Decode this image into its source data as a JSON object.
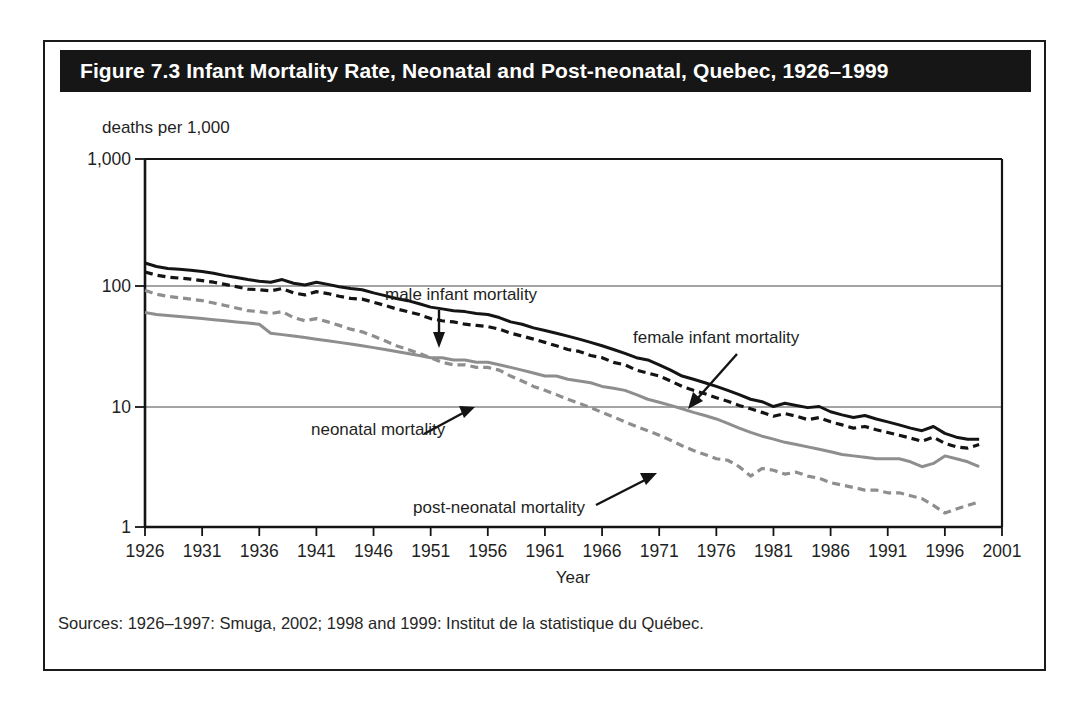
{
  "figure": {
    "title": "Figure 7.3 Infant Mortality Rate, Neonatal and Post-neonatal, Quebec, 1926–1999",
    "source_note": "Sources: 1926–1997: Smuga, 2002; 1998 and 1999: Institut de la statistique du Québec.",
    "title_bar_color": "#161616",
    "title_text_color": "#ffffff",
    "border_color": "#1a1a1a"
  },
  "chart_data": {
    "type": "line",
    "title": "Figure 7.3 Infant Mortality Rate, Neonatal and Post-neonatal, Quebec, 1926–1999",
    "xlabel": "Year",
    "ylabel": "deaths per 1,000",
    "yscale": "log",
    "ylim": [
      1,
      1000
    ],
    "xlim": [
      1926,
      2001
    ],
    "ytick_labels": [
      "1",
      "10",
      "100",
      "1,000"
    ],
    "ytick_values": [
      1,
      10,
      100,
      1000
    ],
    "xtick_labels": [
      "1926",
      "1931",
      "1936",
      "1941",
      "1946",
      "1951",
      "1956",
      "1961",
      "1966",
      "1971",
      "1976",
      "1981",
      "1986",
      "1991",
      "1996",
      "2001"
    ],
    "xtick_values": [
      1926,
      1931,
      1936,
      1941,
      1946,
      1951,
      1956,
      1961,
      1966,
      1971,
      1976,
      1981,
      1986,
      1991,
      1996,
      2001
    ],
    "grid": "horizontal-at-10-and-100",
    "legend_position": "inline-annotations",
    "x": [
      1926,
      1927,
      1928,
      1929,
      1930,
      1931,
      1932,
      1933,
      1934,
      1935,
      1936,
      1937,
      1938,
      1939,
      1940,
      1941,
      1942,
      1943,
      1944,
      1945,
      1946,
      1947,
      1948,
      1949,
      1950,
      1951,
      1952,
      1953,
      1954,
      1955,
      1956,
      1957,
      1958,
      1959,
      1960,
      1961,
      1962,
      1963,
      1964,
      1965,
      1966,
      1967,
      1968,
      1969,
      1970,
      1971,
      1972,
      1973,
      1974,
      1975,
      1976,
      1977,
      1978,
      1979,
      1980,
      1981,
      1982,
      1983,
      1984,
      1985,
      1986,
      1987,
      1988,
      1989,
      1990,
      1991,
      1992,
      1993,
      1994,
      1995,
      1996,
      1997,
      1998,
      1999
    ],
    "series": [
      {
        "name": "male infant mortality",
        "color": "#141414",
        "style": "solid",
        "width": 3,
        "values": [
          142,
          133,
          128,
          126,
          124,
          121,
          117,
          112,
          108,
          104,
          101,
          99,
          104,
          97,
          94,
          99,
          95,
          91,
          88,
          86,
          81,
          77,
          73,
          70,
          66,
          62,
          60,
          58,
          57,
          55,
          54,
          51,
          47,
          45,
          42,
          40,
          38,
          36,
          34,
          32,
          30,
          28,
          26,
          24,
          23,
          21,
          19,
          17,
          16,
          15,
          14,
          13,
          12,
          11,
          10.5,
          9.6,
          10.2,
          9.8,
          9.4,
          9.6,
          8.7,
          8.2,
          7.8,
          8.1,
          7.6,
          7.2,
          6.8,
          6.4,
          6.1,
          6.6,
          5.8,
          5.4,
          5.2,
          5.2
        ]
      },
      {
        "name": "female infant mortality",
        "color": "#141414",
        "style": "dashed",
        "width": 3.2,
        "values": [
          120,
          113,
          109,
          107,
          105,
          102,
          99,
          95,
          91,
          87,
          86,
          84,
          88,
          81,
          78,
          83,
          80,
          76,
          73,
          72,
          68,
          64,
          60,
          57,
          54,
          50,
          48,
          47,
          45,
          44,
          43,
          41,
          38,
          36,
          34,
          32,
          30,
          28,
          27,
          25,
          24,
          22,
          21,
          19,
          18,
          17,
          15.5,
          14,
          13,
          12.2,
          11.3,
          10.6,
          9.8,
          9.2,
          8.6,
          8.0,
          8.4,
          8.0,
          7.5,
          7.8,
          7.2,
          6.8,
          6.4,
          6.6,
          6.2,
          5.9,
          5.6,
          5.3,
          5.0,
          5.4,
          4.8,
          4.5,
          4.4,
          4.7
        ]
      },
      {
        "name": "post-neonatal mortality",
        "color": "#8e8e8e",
        "style": "dashed",
        "width": 3.2,
        "values": [
          85,
          79,
          76,
          74,
          72,
          70,
          67,
          64,
          61,
          58,
          57,
          55,
          57,
          51,
          48,
          50,
          47,
          44,
          41,
          39,
          36,
          33,
          30,
          28,
          26,
          24,
          22,
          21,
          21,
          20,
          20,
          19,
          17,
          15.5,
          14,
          13,
          12,
          11,
          10.2,
          9.4,
          8.6,
          7.9,
          7.2,
          6.6,
          6.1,
          5.6,
          5.1,
          4.6,
          4.2,
          3.9,
          3.6,
          3.5,
          3.1,
          2.6,
          3.0,
          2.9,
          2.7,
          2.8,
          2.6,
          2.5,
          2.3,
          2.2,
          2.1,
          2.0,
          2.0,
          1.9,
          1.9,
          1.8,
          1.7,
          1.5,
          1.3,
          1.4,
          1.5,
          1.6
        ]
      },
      {
        "name": "neonatal mortality",
        "color": "#8e8e8e",
        "style": "solid",
        "width": 3,
        "values": [
          56,
          54,
          53,
          52,
          51,
          50,
          49,
          48,
          47,
          46,
          45,
          38,
          37,
          36,
          35,
          34,
          33,
          32,
          31,
          30,
          29,
          28,
          27,
          26,
          25,
          24,
          24,
          23,
          23,
          22,
          22,
          21,
          20,
          19,
          18,
          17,
          17,
          16,
          15.5,
          15,
          14,
          13.5,
          13,
          12,
          11,
          10.4,
          9.8,
          9.2,
          8.6,
          8.1,
          7.6,
          7.0,
          6.4,
          5.9,
          5.5,
          5.2,
          4.9,
          4.7,
          4.5,
          4.3,
          4.1,
          3.9,
          3.8,
          3.7,
          3.6,
          3.6,
          3.6,
          3.4,
          3.1,
          3.3,
          3.8,
          3.6,
          3.4,
          3.1
        ]
      }
    ],
    "annotations": [
      {
        "label": "male infant mortality",
        "target_series": "male infant mortality",
        "text_x": 340,
        "text_y": 258,
        "arrow": "down"
      },
      {
        "label": "female infant mortality",
        "target_series": "female infant mortality",
        "text_x": 588,
        "text_y": 301,
        "arrow": "down-left"
      },
      {
        "label": "neonatal mortality",
        "target_series": "neonatal mortality",
        "text_x": 266,
        "text_y": 393,
        "arrow": "up-right"
      },
      {
        "label": "post-neonatal mortality",
        "target_series": "post-neonatal mortality",
        "text_x": 368,
        "text_y": 471,
        "arrow": "up-right"
      }
    ]
  }
}
